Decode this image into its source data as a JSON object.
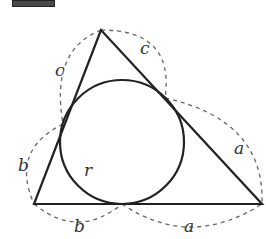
{
  "diagram": {
    "colors": {
      "stroke": "#222222",
      "dashed": "#666666",
      "label": "#333333",
      "header_block": "#4a4a4a"
    },
    "triangle": {
      "vertices": {
        "apex": [
          101,
          30
        ],
        "bottom_left": [
          34,
          204
        ],
        "bottom_right": [
          262,
          204
        ]
      }
    },
    "incircle": {
      "center": [
        122,
        142
      ],
      "radius": 62,
      "label": "r"
    },
    "tangent_points": {
      "left": [
        63,
        124
      ],
      "right": [
        165,
        98
      ],
      "bottom": [
        122,
        204
      ]
    },
    "labels": {
      "c_left": "c",
      "c_right": "c",
      "b_left": "b",
      "b_bottom": "b",
      "a_right": "a",
      "a_bottom": "a",
      "r": "r"
    }
  }
}
